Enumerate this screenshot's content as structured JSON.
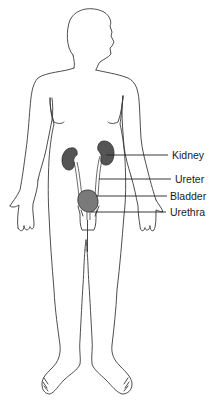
{
  "figure": {
    "labels": [
      {
        "id": "kidney",
        "text": "Kidney"
      },
      {
        "id": "ureter",
        "text": "Ureter"
      },
      {
        "id": "bladder",
        "text": "Bladder"
      },
      {
        "id": "urethra",
        "text": "Urethra"
      }
    ],
    "colors": {
      "outline": "#3a3a3a",
      "kidney": "#555555",
      "bladder": "#7a7a7a",
      "background": "#ffffff"
    }
  }
}
